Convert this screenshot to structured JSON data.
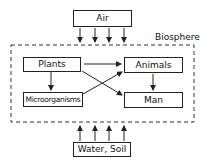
{
  "diagram": {
    "region_label": "Biosphere",
    "nodes": {
      "air": "Air",
      "plants": "Plants",
      "animals": "Animals",
      "microorganisms": "Microorganisms",
      "man": "Man",
      "water_soil": "Water, Soil"
    },
    "edges": [
      {
        "from": "Air",
        "to": "Biosphere",
        "count": 4,
        "direction": "down"
      },
      {
        "from": "Water, Soil",
        "to": "Biosphere",
        "count": 4,
        "direction": "up"
      },
      {
        "from": "Plants",
        "to": "Animals"
      },
      {
        "from": "Plants",
        "to": "Man"
      },
      {
        "from": "Plants",
        "to": "Microorganisms"
      },
      {
        "from": "Microorganisms",
        "to": "Animals"
      },
      {
        "from": "Animals",
        "to": "Man"
      }
    ]
  }
}
